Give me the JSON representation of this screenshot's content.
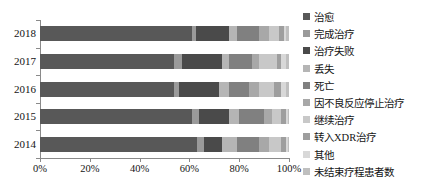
{
  "chart_data": {
    "type": "bar",
    "orientation": "horizontal",
    "stacked": true,
    "normalized": "100%",
    "title": "",
    "subtitle": "",
    "xlabel": "",
    "ylabel": "",
    "xlim": [
      0,
      100
    ],
    "grid": false,
    "legend_position": "right",
    "categories": [
      "2018",
      "2017",
      "2016",
      "2015",
      "2014"
    ],
    "xticks": [
      "0%",
      "20%",
      "40%",
      "60%",
      "80%",
      "100%"
    ],
    "xtick_values": [
      0,
      20,
      40,
      60,
      80,
      100
    ],
    "series": [
      {
        "name": "治愈",
        "color": "#585858",
        "values": [
          61.0,
          54.0,
          54.0,
          61.0,
          63.0
        ]
      },
      {
        "name": "完成治疗",
        "color": "#9a9a9a",
        "values": [
          1.5,
          3.0,
          2.0,
          3.0,
          3.0
        ]
      },
      {
        "name": "治疗失败",
        "color": "#4a4a4a",
        "values": [
          13.5,
          16.0,
          16.0,
          12.0,
          7.0
        ]
      },
      {
        "name": "丢失",
        "color": "#b5b5b5",
        "values": [
          3.0,
          3.0,
          4.0,
          4.0,
          6.0
        ]
      },
      {
        "name": "死亡",
        "color": "#808080",
        "values": [
          9.0,
          9.0,
          8.0,
          10.0,
          9.0
        ]
      },
      {
        "name": "因不良反应停止治疗",
        "color": "#a8a8a8",
        "values": [
          4.0,
          3.0,
          4.0,
          3.0,
          4.0
        ]
      },
      {
        "name": "继续治疗",
        "color": "#c8c8c8",
        "values": [
          4.0,
          7.0,
          6.0,
          4.0,
          5.0
        ]
      },
      {
        "name": "转入XDR治疗",
        "color": "#9e9e9e",
        "values": [
          2.0,
          2.0,
          3.0,
          2.0,
          2.0
        ]
      },
      {
        "name": "其他",
        "color": "#d8d8d8",
        "values": [
          1.0,
          2.0,
          2.0,
          0.5,
          0.5
        ]
      },
      {
        "name": "未结束疗程患者数",
        "color": "#bfbfbf",
        "values": [
          1.0,
          1.0,
          1.0,
          0.5,
          0.5
        ]
      }
    ]
  },
  "legend": {
    "items": [
      {
        "label": "治愈"
      },
      {
        "label": "完成治疗"
      },
      {
        "label": "治疗失败"
      },
      {
        "label": "丢失"
      },
      {
        "label": "死亡"
      },
      {
        "label": "因不良反应停止治疗"
      },
      {
        "label": "继续治疗"
      },
      {
        "label": "转入XDR治疗"
      },
      {
        "label": "其他"
      },
      {
        "label": "未结束疗程患者数"
      }
    ]
  }
}
